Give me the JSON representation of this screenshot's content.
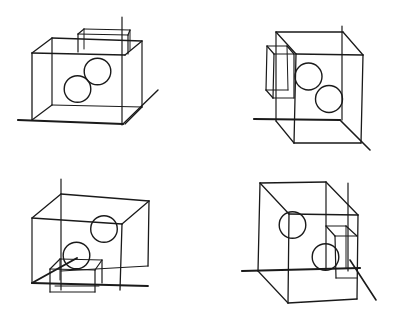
{
  "figure": {
    "width": 394,
    "height": 317,
    "stroke_color": "#1a1a1a",
    "background": "#ffffff",
    "panels": [
      {
        "id": "top-left",
        "lines": [
          [
            18,
            120,
            123,
            124,
            2.2
          ],
          [
            123,
            124,
            158,
            90,
            1.4
          ],
          [
            122,
            17,
            122,
            125,
            1.2
          ],
          [
            32,
            53,
            125,
            55,
            1.5
          ],
          [
            52,
            38,
            142,
            41,
            1.3
          ],
          [
            32,
            53,
            52,
            38,
            1.3
          ],
          [
            125,
            55,
            142,
            41,
            1.3
          ],
          [
            32,
            53,
            32,
            120,
            1.3
          ],
          [
            52,
            38,
            52,
            105,
            1.2
          ],
          [
            142,
            41,
            142,
            107,
            1.2
          ],
          [
            52,
            105,
            142,
            107,
            1.2
          ],
          [
            32,
            120,
            52,
            105,
            1.2
          ],
          [
            125,
            124,
            142,
            107,
            1.2
          ],
          [
            78,
            34,
            128,
            35,
            1.2
          ],
          [
            84,
            29,
            130,
            30,
            1.2
          ],
          [
            78,
            34,
            84,
            29,
            1.2
          ],
          [
            128,
            35,
            130,
            30,
            1.2
          ],
          [
            78,
            34,
            78,
            52,
            1.2
          ],
          [
            84,
            29,
            84,
            49,
            1.0
          ],
          [
            128,
            35,
            128,
            54,
            1.2
          ],
          [
            130,
            30,
            130,
            50,
            1.0
          ]
        ],
        "circles": [
          [
            97.5,
            71.5,
            13.3
          ],
          [
            77.5,
            89,
            13.3
          ]
        ]
      },
      {
        "id": "top-right",
        "lines": [
          [
            254,
            119,
            340,
            120,
            2.2
          ],
          [
            340,
            120,
            370,
            150,
            1.6
          ],
          [
            342,
            26,
            342,
            120,
            1.2
          ],
          [
            276,
            32,
            343,
            32,
            1.3
          ],
          [
            296,
            54,
            363,
            55,
            1.3
          ],
          [
            276,
            32,
            296,
            54,
            1.3
          ],
          [
            343,
            32,
            363,
            55,
            1.3
          ],
          [
            276,
            32,
            276,
            121,
            1.2
          ],
          [
            296,
            54,
            294,
            143,
            1.3
          ],
          [
            363,
            55,
            361,
            143,
            1.3
          ],
          [
            294,
            143,
            361,
            143,
            1.3
          ],
          [
            276,
            121,
            294,
            143,
            1.2
          ],
          [
            267,
            46,
            287,
            46,
            1.2
          ],
          [
            274,
            54,
            294,
            54,
            1.2
          ],
          [
            267,
            46,
            274,
            54,
            1.2
          ],
          [
            287,
            46,
            294,
            54,
            1.2
          ],
          [
            267,
            46,
            266,
            90,
            1.2
          ],
          [
            274,
            54,
            273,
            98,
            1.2
          ],
          [
            287,
            46,
            288,
            90,
            1.0
          ],
          [
            294,
            54,
            294,
            98,
            1.2
          ],
          [
            266,
            90,
            288,
            90,
            1.2
          ],
          [
            273,
            98,
            294,
            98,
            1.2
          ],
          [
            266,
            90,
            273,
            98,
            1.2
          ]
        ],
        "circles": [
          [
            308.5,
            76.5,
            13.5
          ],
          [
            329,
            99,
            13.5
          ]
        ]
      },
      {
        "id": "bottom-left",
        "lines": [
          [
            32,
            283,
            77,
            258,
            2.0
          ],
          [
            61,
            179,
            61,
            290,
            1.2
          ],
          [
            32,
            218,
            122,
            224,
            1.3
          ],
          [
            61,
            194,
            149,
            201,
            1.3
          ],
          [
            32,
            218,
            61,
            194,
            1.3
          ],
          [
            122,
            224,
            149,
            201,
            1.3
          ],
          [
            32,
            218,
            32,
            283,
            1.2
          ],
          [
            122,
            224,
            120,
            290,
            1.3
          ],
          [
            149,
            201,
            148,
            266,
            1.3
          ],
          [
            32,
            283,
            148,
            286,
            1.8
          ],
          [
            61,
            271,
            148,
            266,
            1.2
          ],
          [
            50,
            269,
            95,
            270,
            1.2
          ],
          [
            60,
            259,
            102,
            260,
            1.2
          ],
          [
            50,
            269,
            60,
            259,
            1.2
          ],
          [
            95,
            270,
            102,
            260,
            1.2
          ],
          [
            50,
            269,
            50,
            292,
            1.2
          ],
          [
            60,
            259,
            60,
            280,
            1.0
          ],
          [
            95,
            270,
            95,
            292,
            1.2
          ],
          [
            102,
            260,
            102,
            283,
            1.2
          ],
          [
            50,
            292,
            95,
            292,
            1.2
          ],
          [
            55,
            286,
            99,
            286,
            1.0
          ]
        ],
        "circles": [
          [
            104,
            229,
            13.3
          ],
          [
            76.5,
            255.5,
            13.3
          ]
        ]
      },
      {
        "id": "bottom-right",
        "lines": [
          [
            242,
            271,
            360,
            268,
            2.2
          ],
          [
            350,
            260,
            376,
            300,
            1.6
          ],
          [
            348,
            183,
            348,
            271,
            1.2
          ],
          [
            260,
            183,
            326,
            182,
            1.3
          ],
          [
            289,
            214,
            358,
            215,
            1.3
          ],
          [
            260,
            183,
            289,
            214,
            1.3
          ],
          [
            326,
            182,
            358,
            215,
            1.3
          ],
          [
            260,
            183,
            258,
            271,
            1.3
          ],
          [
            289,
            214,
            288,
            303,
            1.3
          ],
          [
            326,
            182,
            326,
            269,
            1.2
          ],
          [
            358,
            215,
            357,
            299,
            1.3
          ],
          [
            288,
            303,
            357,
            299,
            1.3
          ],
          [
            258,
            271,
            288,
            303,
            1.2
          ],
          [
            326,
            226,
            346,
            226,
            1.2
          ],
          [
            335,
            236,
            357,
            236,
            1.2
          ],
          [
            326,
            226,
            335,
            236,
            1.2
          ],
          [
            346,
            226,
            357,
            236,
            1.2
          ],
          [
            335,
            236,
            336,
            278,
            1.2
          ],
          [
            346,
            226,
            346,
            268,
            1.0
          ],
          [
            336,
            278,
            357,
            278,
            1.2
          ]
        ],
        "circles": [
          [
            292.5,
            225,
            13.3
          ],
          [
            325.5,
            257,
            13.3
          ]
        ]
      }
    ]
  }
}
